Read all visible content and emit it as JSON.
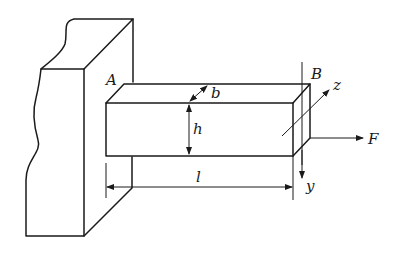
{
  "diagram": {
    "type": "cantilever-beam",
    "labels": {
      "fixed_end": "A",
      "free_end": "B",
      "width": "b",
      "height": "h",
      "length": "l",
      "force": "F",
      "axis_y": "y",
      "axis_z": "z"
    },
    "colors": {
      "line": "#1a1a1a",
      "background": "#ffffff"
    }
  }
}
